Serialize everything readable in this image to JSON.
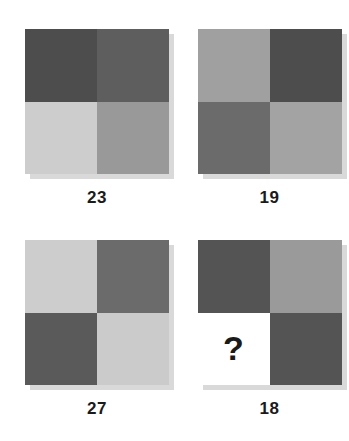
{
  "puzzle": {
    "title": "Pattern matrix puzzle",
    "shadow_color": "#d9d9d9",
    "background_color": "#ffffff",
    "label_color": "#1a1a1a",
    "question_mark": "?",
    "cards": [
      {
        "label": "23",
        "name": "card-23",
        "quadrants": [
          {
            "name": "top-left",
            "color": "#4d4d4d",
            "text": ""
          },
          {
            "name": "top-right",
            "color": "#5e5e5e",
            "text": ""
          },
          {
            "name": "bottom-left",
            "color": "#cdcdcd",
            "text": ""
          },
          {
            "name": "bottom-right",
            "color": "#999999",
            "text": ""
          }
        ]
      },
      {
        "label": "19",
        "name": "card-19",
        "quadrants": [
          {
            "name": "top-left",
            "color": "#a0a0a0",
            "text": ""
          },
          {
            "name": "top-right",
            "color": "#4d4d4d",
            "text": ""
          },
          {
            "name": "bottom-left",
            "color": "#6b6b6b",
            "text": ""
          },
          {
            "name": "bottom-right",
            "color": "#a3a3a3",
            "text": ""
          }
        ]
      },
      {
        "label": "27",
        "name": "card-27",
        "quadrants": [
          {
            "name": "top-left",
            "color": "#cdcdcd",
            "text": ""
          },
          {
            "name": "top-right",
            "color": "#6b6b6b",
            "text": ""
          },
          {
            "name": "bottom-left",
            "color": "#5a5a5a",
            "text": ""
          },
          {
            "name": "bottom-right",
            "color": "#cbcbcb",
            "text": ""
          }
        ]
      },
      {
        "label": "18",
        "name": "card-18",
        "quadrants": [
          {
            "name": "top-left",
            "color": "#545454",
            "text": ""
          },
          {
            "name": "top-right",
            "color": "#9a9a9a",
            "text": ""
          },
          {
            "name": "bottom-left",
            "color": "#ffffff",
            "text": "?"
          },
          {
            "name": "bottom-right",
            "color": "#545454",
            "text": ""
          }
        ]
      }
    ]
  }
}
